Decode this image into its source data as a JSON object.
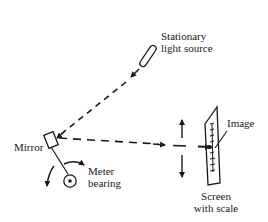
{
  "diagram": {
    "type": "light-beam meter (mirror galvanometer) schematic",
    "labels": {
      "light_source_line1": "Stationary",
      "light_source_line2": "light source",
      "mirror": "Mirror",
      "meter_bearing_line1": "Meter",
      "meter_bearing_line2": "bearing",
      "image": "Image",
      "screen_line1": "Screen",
      "screen_line2": "with scale"
    },
    "colors": {
      "ink": "#1a1a1a",
      "background": "#ffffff"
    }
  }
}
